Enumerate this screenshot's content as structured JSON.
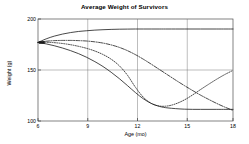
{
  "chart_data": {
    "type": "line",
    "title": "Average Weight of Survivors",
    "xlabel": "Age (mo)",
    "ylabel": "Weight (g)",
    "xlim": [
      6,
      18
    ],
    "ylim": [
      100,
      200
    ],
    "xticks": [
      6,
      9,
      12,
      15,
      18
    ],
    "xtick_labels": [
      "6",
      "9",
      "12",
      "15",
      "18"
    ],
    "yticks": [
      100,
      150,
      200
    ],
    "ytick_labels": [
      "100",
      "150",
      "200"
    ],
    "grid": true,
    "legend": "none",
    "marker_note": "start-marker at (6, 177)",
    "series": [
      {
        "name": "series-1-solid-rising",
        "style": "solid",
        "color": "#1a1a1a",
        "x": [
          6,
          6.5,
          7,
          7.5,
          8,
          8.5,
          9,
          9.5,
          10,
          10.5,
          11,
          11.5,
          12,
          12.5,
          13,
          13.5,
          14,
          15,
          16,
          17,
          18
        ],
        "y": [
          177,
          180.5,
          183.2,
          185.2,
          186.7,
          187.8,
          188.5,
          189.1,
          189.5,
          189.8,
          190.0,
          190.1,
          190.2,
          190.2,
          190.2,
          190.2,
          190.2,
          190.2,
          190.2,
          190.2,
          190.2
        ]
      },
      {
        "name": "series-2-dashdot-declining",
        "style": "dashdot",
        "color": "#1a1a1a",
        "x": [
          6,
          6.5,
          7,
          7.5,
          8,
          8.5,
          9,
          9.5,
          10,
          10.5,
          11,
          11.5,
          12,
          12.5,
          13,
          13.5,
          14,
          14.5,
          15,
          15.5,
          16,
          16.5,
          17,
          17.5,
          18
        ],
        "y": [
          177,
          178.2,
          178.8,
          179.0,
          179.0,
          178.8,
          178.4,
          177.6,
          176.4,
          174.6,
          172.2,
          169.0,
          165.0,
          160.4,
          155.4,
          150.2,
          145.0,
          139.8,
          134.8,
          130.0,
          125.4,
          121.2,
          117.2,
          113.6,
          110.4
        ]
      },
      {
        "name": "series-3-dotted-u-shaped",
        "style": "dotted",
        "color": "#1a1a1a",
        "x": [
          6,
          6.5,
          7,
          7.5,
          8,
          8.5,
          9,
          9.5,
          10,
          10.5,
          11,
          11.5,
          12,
          12.5,
          13,
          13.5,
          14,
          14.5,
          15,
          15.5,
          16,
          16.5,
          17,
          17.5,
          18
        ],
        "y": [
          177,
          177.2,
          176.8,
          176.0,
          174.8,
          173.2,
          171.2,
          168.6,
          165.2,
          160.6,
          154.2,
          145.0,
          133.0,
          123.0,
          117.0,
          114.6,
          114.8,
          117.0,
          120.6,
          125.4,
          130.8,
          136.0,
          141.0,
          145.6,
          149.6
        ]
      },
      {
        "name": "series-4-solid-flat-bottom",
        "style": "solid",
        "color": "#1a1a1a",
        "x": [
          6,
          6.5,
          7,
          7.5,
          8,
          8.5,
          9,
          9.5,
          10,
          10.5,
          11,
          11.5,
          12,
          12.5,
          13,
          13.5,
          14,
          15,
          16,
          17,
          18
        ],
        "y": [
          177,
          175.6,
          173.8,
          171.6,
          169.0,
          166.0,
          162.4,
          158.2,
          153.4,
          147.8,
          141.6,
          134.8,
          127.8,
          121.6,
          117.0,
          114.2,
          112.8,
          111.6,
          111.4,
          111.4,
          111.4
        ]
      }
    ]
  },
  "axes": {
    "y_tick_200": "200",
    "y_tick_150": "150",
    "y_tick_100": "100",
    "x_tick_6": "6",
    "x_tick_9": "9",
    "x_tick_12": "12",
    "x_tick_15": "15",
    "x_tick_18": "18",
    "ylabel": "Weight (g)",
    "xlabel": "Age (mo)"
  },
  "header": {
    "title": "Average Weight of Survivors"
  }
}
